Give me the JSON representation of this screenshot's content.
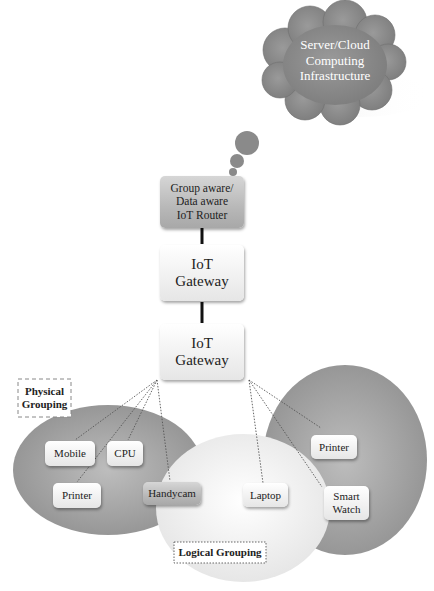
{
  "diagram": {
    "cloud": {
      "label": "Server/Cloud\nComputing\nInfrastructure",
      "color": "#8c8c8c"
    },
    "router": {
      "label": "Group aware/\nData aware\nIoT Router"
    },
    "gateways": [
      {
        "label": "IoT\nGateway"
      },
      {
        "label": "IoT\nGateway"
      }
    ],
    "groups": {
      "physical_label": "Physical\nGrouping",
      "logical_label": "Logical Grouping"
    },
    "devices": {
      "left_group": [
        {
          "label": "Mobile"
        },
        {
          "label": "CPU"
        },
        {
          "label": "Printer"
        }
      ],
      "shared": [
        {
          "label": "Handycam"
        },
        {
          "label": "Laptop"
        }
      ],
      "right_group": [
        {
          "label": "Printer"
        },
        {
          "label": "Smart\nWatch"
        }
      ]
    },
    "colors": {
      "ellipse_dark": "#a9a9a9",
      "ellipse_light": "#f2f2f2",
      "link": "#111111"
    }
  }
}
